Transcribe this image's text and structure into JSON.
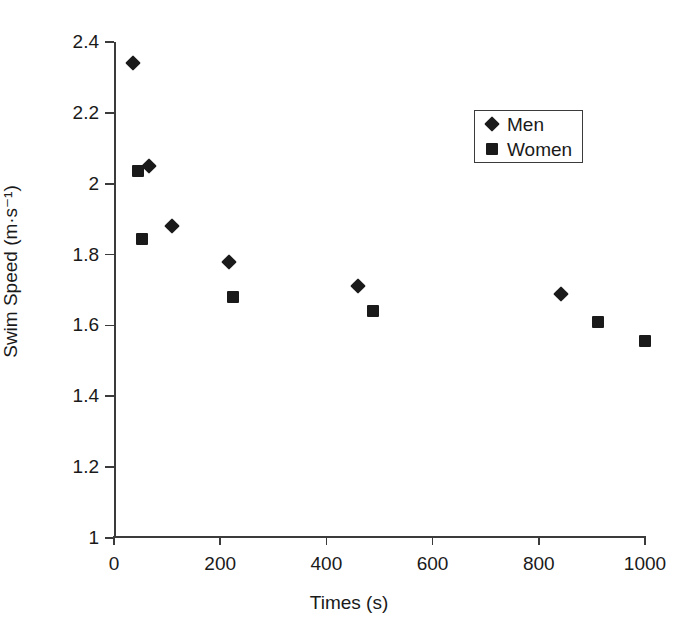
{
  "chart_data": {
    "type": "scatter",
    "title": "",
    "xlabel": "Times (s)",
    "ylabel": "Swim Speed (m·s⁻¹)",
    "xlim": [
      0,
      1000
    ],
    "ylim": [
      1,
      2.4
    ],
    "xticks": [
      "0",
      "200",
      "400",
      "600",
      "800",
      "1000"
    ],
    "xtick_values": [
      0,
      200,
      400,
      600,
      800,
      1000
    ],
    "yticks": [
      "1",
      "1.2",
      "1.4",
      "1.6",
      "1.8",
      "2",
      "2.2",
      "2.4"
    ],
    "ytick_values": [
      1,
      1.2,
      1.4,
      1.6,
      1.8,
      2,
      2.2,
      2.4
    ],
    "grid": false,
    "legend_position": "upper right",
    "series": [
      {
        "name": "Men",
        "marker": "diamond",
        "color": "#1a1a1a",
        "points": [
          {
            "x": 36,
            "y": 2.34
          },
          {
            "x": 66,
            "y": 2.05
          },
          {
            "x": 109,
            "y": 1.88
          },
          {
            "x": 216,
            "y": 1.78
          },
          {
            "x": 460,
            "y": 1.71
          },
          {
            "x": 842,
            "y": 1.69
          }
        ]
      },
      {
        "name": "Women",
        "marker": "square",
        "color": "#1a1a1a",
        "points": [
          {
            "x": 45,
            "y": 2.035
          },
          {
            "x": 53,
            "y": 1.845
          },
          {
            "x": 224,
            "y": 1.68
          },
          {
            "x": 487,
            "y": 1.64
          },
          {
            "x": 911,
            "y": 1.61
          },
          {
            "x": 1000,
            "y": 1.555
          }
        ]
      }
    ]
  },
  "legend": {
    "entries": [
      {
        "label": "Men",
        "marker": "diamond"
      },
      {
        "label": "Women",
        "marker": "square"
      }
    ]
  },
  "axes": {
    "x_title": "Times (s)",
    "y_title": "Swim Speed (m·s⁻¹)"
  }
}
